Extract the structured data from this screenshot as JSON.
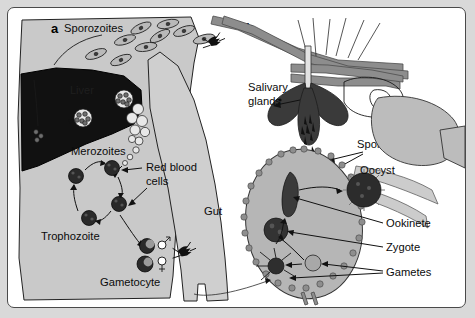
{
  "figure": {
    "background_color": "#d9d9d9",
    "frame_color": "#ffffff"
  },
  "panels": [
    {
      "id": "a",
      "label": "a",
      "subject": "human host",
      "labels": [
        {
          "name": "sporozoites",
          "text": "Sporozoites"
        },
        {
          "name": "liver",
          "text": "Liver"
        },
        {
          "name": "merozoites",
          "text": "Merozoites"
        },
        {
          "name": "red-blood-cells-line1",
          "text": "Red blood"
        },
        {
          "name": "red-blood-cells-line2",
          "text": "cells"
        },
        {
          "name": "trophozoite",
          "text": "Trophozoite"
        },
        {
          "name": "gametocyte",
          "text": "Gametocyte"
        }
      ],
      "symbols": [
        {
          "name": "male-symbol",
          "glyph": "♂"
        },
        {
          "name": "female-symbol",
          "glyph": "♀"
        }
      ]
    },
    {
      "id": "b",
      "label": "b",
      "subject": "mosquito vector",
      "labels": [
        {
          "name": "salivary-glands-line1",
          "text": "Salivary"
        },
        {
          "name": "salivary-glands-line2",
          "text": "glands"
        },
        {
          "name": "sporozoites",
          "text": "Sporozoites"
        },
        {
          "name": "oocyst",
          "text": "Oocyst"
        },
        {
          "name": "gut",
          "text": "Gut"
        },
        {
          "name": "ookinete",
          "text": "Ookinete"
        },
        {
          "name": "zygote",
          "text": "Zygote"
        },
        {
          "name": "gametes",
          "text": "Gametes"
        }
      ]
    }
  ],
  "colors": {
    "page_background": "#d9d9d9",
    "panel_background": "#ffffff",
    "human_body": "#c9c9c9",
    "liver": "#111111",
    "mosquito_leg": "#8d8d8d",
    "salivary_gland": "#3a3a3a",
    "gut": "#b6b6b6",
    "text": "#0b0b0b"
  }
}
